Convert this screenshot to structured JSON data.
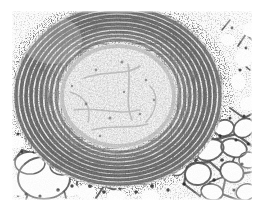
{
  "image": {
    "kind": "histology-micrograph",
    "subject": "lung tissue with bronchiole / muscular vessel in cross-section",
    "stain": "hematoxylin and eosin",
    "rendering": "grayscale halftone scan",
    "width_px": 260,
    "height_px": 213,
    "alt_text": "Grayscale histological micrograph of lung tissue: a rounded central structure with a pale, finely granular lumen is encircled by thick concentric layers of densely packed dark-staining spindle cells and fibers; surrounding parenchyma shows white polygonal alveolar airspaces separated by thin cellular septa."
  },
  "plate": {
    "left": 12,
    "top": 11,
    "width": 240,
    "height": 189,
    "background_hex": "#fbfbfb",
    "border_hex": "#d8d8d8"
  },
  "colors": {
    "paper_white": "#ffffff",
    "field_white": "#fbfbfb",
    "lumen_pale": "#eeeeee",
    "tissue_mid_gray": "#9a9a9a",
    "nuclei_dark": "#2a2a2a",
    "septa_gray": "#6b6b6b",
    "scan_noise": "#8a8a8a"
  },
  "regions": [
    {
      "id": "central-lumen",
      "label": "Central lumen",
      "description": "Pale, finely speckled round core of the vessel or airway",
      "center_x": 118,
      "center_y": 96,
      "radius_x": 58,
      "radius_y": 52,
      "tone": "very light gray"
    },
    {
      "id": "concentric-wall",
      "label": "Concentric wall layers",
      "description": "Thick, multi-layered ring of dark spindle-shaped cells arranged circumferentially around the lumen",
      "center_x": 118,
      "center_y": 96,
      "outer_radius_x": 104,
      "outer_radius_y": 88,
      "tone": "dark gray to near black"
    },
    {
      "id": "alveolar-parenchyma",
      "label": "Alveolar parenchyma",
      "description": "Surrounding lung tissue with white polygonal airspaces bounded by thin dark septal walls",
      "tone": "white spaces with thin dark outlines"
    },
    {
      "id": "large-alveolus-lower-left",
      "label": "Large alveolar space",
      "description": "Prominent rounded white airspace at lower left of the field",
      "center_x": 44,
      "center_y": 178,
      "radius_x": 26,
      "radius_y": 22
    }
  ],
  "annotations": {
    "scalebar": null,
    "labels": [],
    "caption": null,
    "magnification": null
  },
  "artifacts": {
    "top_scan_band": "faint horizontal speckle band from page scan along the top margin",
    "bottom_margin": "blank white paper margin below the plate"
  }
}
